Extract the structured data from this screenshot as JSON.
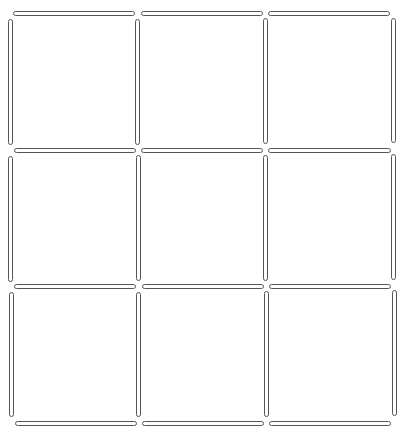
{
  "puzzle": {
    "title": "",
    "grid": "3x3 matchstick grid",
    "stick_color": "#555555",
    "background": "#ffffff",
    "horizontal": [
      {
        "row": 0,
        "sticks": [
          {
            "x": 13,
            "y": 11,
            "w": 122
          },
          {
            "x": 141,
            "y": 11,
            "w": 122
          },
          {
            "x": 268,
            "y": 11,
            "w": 122
          }
        ]
      },
      {
        "row": 1,
        "sticks": [
          {
            "x": 14,
            "y": 148,
            "w": 122
          },
          {
            "x": 141,
            "y": 148,
            "w": 122
          },
          {
            "x": 268,
            "y": 148,
            "w": 123
          }
        ]
      },
      {
        "row": 2,
        "sticks": [
          {
            "x": 14,
            "y": 284,
            "w": 122
          },
          {
            "x": 142,
            "y": 284,
            "w": 122
          },
          {
            "x": 269,
            "y": 284,
            "w": 122
          }
        ]
      },
      {
        "row": 3,
        "sticks": [
          {
            "x": 15,
            "y": 421,
            "w": 122
          },
          {
            "x": 142,
            "y": 421,
            "w": 122
          },
          {
            "x": 269,
            "y": 421,
            "w": 122
          }
        ]
      }
    ],
    "vertical": [
      {
        "col": 0,
        "sticks": [
          {
            "x": 8,
            "y": 19,
            "h": 126
          },
          {
            "x": 8,
            "y": 156,
            "h": 126
          },
          {
            "x": 9,
            "y": 292,
            "h": 125
          }
        ]
      },
      {
        "col": 1,
        "sticks": [
          {
            "x": 135,
            "y": 19,
            "h": 126
          },
          {
            "x": 136,
            "y": 155,
            "h": 126
          },
          {
            "x": 136,
            "y": 292,
            "h": 125
          }
        ]
      },
      {
        "col": 2,
        "sticks": [
          {
            "x": 263,
            "y": 18,
            "h": 126
          },
          {
            "x": 263,
            "y": 155,
            "h": 126
          },
          {
            "x": 264,
            "y": 291,
            "h": 126
          }
        ]
      },
      {
        "col": 3,
        "sticks": [
          {
            "x": 391,
            "y": 18,
            "h": 125
          },
          {
            "x": 391,
            "y": 154,
            "h": 126
          },
          {
            "x": 392,
            "y": 290,
            "h": 126
          }
        ]
      }
    ]
  }
}
